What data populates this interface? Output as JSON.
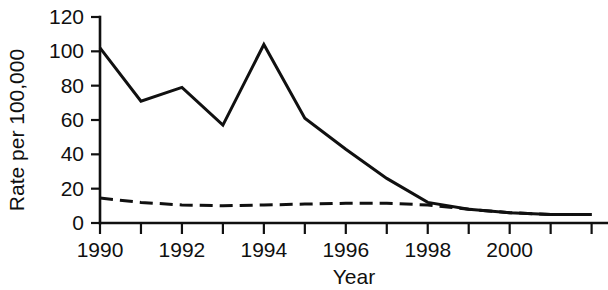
{
  "chart_data": {
    "type": "line",
    "title": "",
    "xlabel": "Year",
    "ylabel": "Rate per 100,000",
    "x": [
      1990,
      1991,
      1992,
      1993,
      1994,
      1995,
      1996,
      1997,
      1998,
      1999,
      2000,
      2001,
      2002
    ],
    "xlim": [
      1990,
      2002.4
    ],
    "ylim": [
      0,
      120
    ],
    "xticks": [
      1990,
      1991,
      1992,
      1993,
      1994,
      1995,
      1996,
      1997,
      1998,
      1999,
      2000,
      2001,
      2002
    ],
    "xtick_labels": [
      "1990",
      "",
      "1992",
      "",
      "1994",
      "",
      "1996",
      "",
      "1998",
      "",
      "2000",
      "",
      ""
    ],
    "yticks": [
      0,
      20,
      40,
      60,
      80,
      100,
      120
    ],
    "ytick_labels": [
      "0",
      "20",
      "40",
      "60",
      "80",
      "100",
      "120"
    ],
    "grid": false,
    "legend": "none",
    "series": [
      {
        "name": "solid-line",
        "style": "solid",
        "color": "#101010",
        "values": [
          102,
          71,
          79,
          57,
          104,
          61,
          43,
          26,
          12,
          8,
          6,
          5,
          5
        ]
      },
      {
        "name": "dashed-line",
        "style": "dashed",
        "color": "#101010",
        "values": [
          14.5,
          12,
          10.5,
          10,
          10.5,
          11,
          11.5,
          11.5,
          10.5,
          8,
          6,
          5,
          5
        ]
      }
    ]
  },
  "axes": {
    "y_axis_title": "Rate per 100,000",
    "x_axis_title": "Year"
  }
}
